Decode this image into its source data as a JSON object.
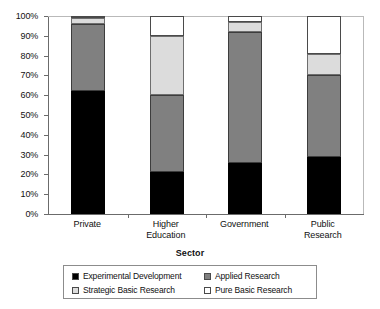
{
  "chart_data": {
    "type": "bar",
    "stacked": true,
    "stack_mode": "percent",
    "title": "",
    "subtitle": "",
    "xlabel": "Sector",
    "ylabel": "",
    "ylim": [
      0,
      100
    ],
    "ytick_labels": [
      "0%",
      "10%",
      "20%",
      "30%",
      "40%",
      "50%",
      "60%",
      "70%",
      "80%",
      "90%",
      "100%"
    ],
    "ytick_values": [
      0,
      10,
      20,
      30,
      40,
      50,
      60,
      70,
      80,
      90,
      100
    ],
    "grid": false,
    "legend_position": "bottom",
    "categories": [
      "Private",
      "Higher Education",
      "Government",
      "Public Research"
    ],
    "category_label_lines": [
      [
        "Private"
      ],
      [
        "Higher",
        "Education"
      ],
      [
        "Government"
      ],
      [
        "Public",
        "Research"
      ]
    ],
    "series": [
      {
        "name": "Experimental Development",
        "color": "#000000",
        "values": [
          62,
          21,
          26,
          29
        ]
      },
      {
        "name": "Applied Research",
        "color": "#808080",
        "values": [
          34,
          39,
          66,
          41
        ]
      },
      {
        "name": "Strategic Basic Research",
        "color": "#dcdcdc",
        "values": [
          3,
          30,
          5,
          11
        ]
      },
      {
        "name": "Pure Basic Research",
        "color": "#ffffff",
        "values": [
          1,
          10,
          3,
          19
        ]
      }
    ],
    "cumulative_tops": {
      "Private": [
        62,
        96,
        99,
        100
      ],
      "Higher Education": [
        21,
        60,
        90,
        100
      ],
      "Government": [
        26,
        92,
        97,
        100
      ],
      "Public Research": [
        29,
        70,
        81,
        100
      ]
    }
  },
  "legend": {
    "entries": [
      {
        "label": "Experimental Development",
        "swatch": "#000000",
        "swatch_name": "legend-swatch-experimental-development"
      },
      {
        "label": "Applied Research",
        "swatch": "#808080",
        "swatch_name": "legend-swatch-applied-research"
      },
      {
        "label": "Strategic Basic Research",
        "swatch": "#dcdcdc",
        "swatch_name": "legend-swatch-strategic-basic-research"
      },
      {
        "label": "Pure Basic Research",
        "swatch": "#ffffff",
        "swatch_name": "legend-swatch-pure-basic-research"
      }
    ]
  },
  "axis": {
    "x_title": "Sector",
    "y_ticks": [
      "100%",
      "90%",
      "80%",
      "70%",
      "60%",
      "50%",
      "40%",
      "30%",
      "20%",
      "10%",
      "0%"
    ]
  }
}
